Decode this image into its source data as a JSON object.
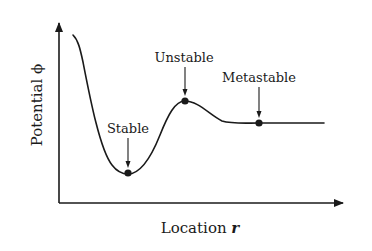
{
  "diagram": {
    "type": "potential-energy-curve",
    "x_axis": {
      "label": "Location",
      "variable": "r"
    },
    "y_axis": {
      "label": "Potential",
      "variable": "ϕ"
    },
    "points": [
      {
        "id": "stable",
        "label": "Stable",
        "x": 128,
        "y": 173,
        "label_x": 128,
        "label_y": 133,
        "arrow_from": 138,
        "arrow_to": 166
      },
      {
        "id": "unstable",
        "label": "Unstable",
        "x": 185,
        "y": 101,
        "label_x": 184,
        "label_y": 62,
        "arrow_from": 67,
        "arrow_to": 94
      },
      {
        "id": "metastable",
        "label": "Metastable",
        "x": 259,
        "y": 123,
        "label_x": 259,
        "label_y": 82,
        "arrow_from": 87,
        "arrow_to": 116
      }
    ],
    "colors": {
      "ink": "#1a1a1a",
      "background": "#ffffff"
    }
  }
}
